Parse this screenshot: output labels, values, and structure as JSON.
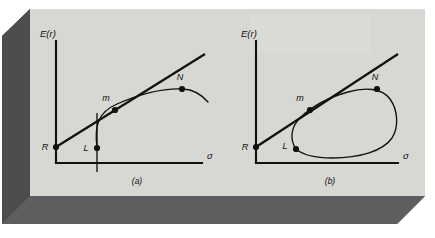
{
  "figure": {
    "kind": "line-diagram",
    "background_color": "#ffffff",
    "panel_fill": "#d5d5d1",
    "shadow_color": "#58585a",
    "ink_color": "#111111",
    "frame": {
      "name": "beveled-3d-frame",
      "panel_x": 30,
      "panel_y": 9,
      "panel_w": 395,
      "panel_h": 187,
      "bevel_depth": 28
    },
    "panels": [
      {
        "id": "a",
        "caption": "(a)",
        "caption_x": 137,
        "caption_y": 184,
        "y_axis_label": "E(r)",
        "y_axis_label_x": 40,
        "y_axis_label_y": 37,
        "x_axis_label": "σ",
        "x_axis_label_x": 207,
        "x_axis_label_y": 159,
        "origin_x": 56,
        "origin_y": 163,
        "y_axis_top": 41,
        "x_axis_right": 202,
        "tangent_line": {
          "x1": 56,
          "y1": 147,
          "x2": 205,
          "y2": 54
        },
        "frontier_path": "M 97,148 C 94,124 99,112 117,104 C 140,94 163,88 183,89 C 193,89.5 201,94 208,102",
        "tick_path": "M 97,113 L 97,172",
        "points": [
          {
            "name": "R",
            "label": "R",
            "x": 56,
            "y": 147,
            "label_x": 45,
            "label_y": 150,
            "dot_r": 3.1
          },
          {
            "name": "L",
            "label": "L",
            "x": 97,
            "y": 148,
            "label_x": 86,
            "label_y": 151,
            "dot_r": 3.1
          },
          {
            "name": "m",
            "label": "m",
            "x": 115,
            "y": 110,
            "label_x": 106,
            "label_y": 101,
            "dot_r": 3.1
          },
          {
            "name": "N",
            "label": "N",
            "x": 182,
            "y": 89,
            "label_x": 180,
            "label_y": 80,
            "dot_r": 3.1
          }
        ]
      },
      {
        "id": "b",
        "caption": "(b)",
        "caption_x": 330,
        "caption_y": 184,
        "y_axis_label": "E(r)",
        "y_axis_label_x": 241,
        "y_axis_label_y": 37,
        "x_axis_label": "σ",
        "x_axis_label_x": 403,
        "x_axis_label_y": 159,
        "origin_x": 256,
        "origin_y": 163,
        "y_axis_top": 41,
        "x_axis_right": 398,
        "tangent_line": {
          "x1": 256,
          "y1": 147,
          "x2": 398,
          "y2": 54
        },
        "frontier_path": "M 296,149 C 290,140 290,128 300,118 C 312,106 330,97 348,92 C 365,87 382,88 390,99 C 398,110 399,127 392,138 C 383,151 360,158 332,158 C 316,158 303,155 296,149 Z",
        "points": [
          {
            "name": "R",
            "label": "R",
            "x": 256,
            "y": 147,
            "label_x": 245,
            "label_y": 150,
            "dot_r": 3.1
          },
          {
            "name": "L",
            "label": "L",
            "x": 296,
            "y": 149,
            "label_x": 285,
            "label_y": 149,
            "dot_r": 3.1
          },
          {
            "name": "m",
            "label": "m",
            "x": 310,
            "y": 110,
            "label_x": 300,
            "label_y": 101,
            "dot_r": 3.1
          },
          {
            "name": "N",
            "label": "N",
            "x": 377,
            "y": 89,
            "label_x": 375,
            "label_y": 80,
            "dot_r": 3.1
          }
        ]
      }
    ]
  }
}
